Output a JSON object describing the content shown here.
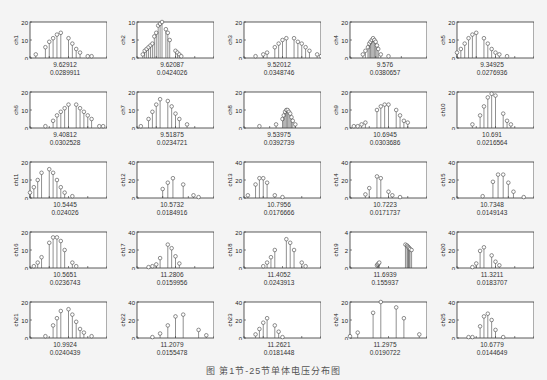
{
  "caption": "图  第1节-25节单体电压分布图",
  "chart_data": [
    {
      "type": "scatter",
      "name": "ch1",
      "ylabel": "ch1",
      "xlim": [
        9.55,
        9.75
      ],
      "ylim": [
        0,
        20
      ],
      "xticks": [
        "9.55",
        "9.6",
        "9.65",
        "9.7",
        "9.75"
      ],
      "yticks": [
        "0",
        "10",
        "20"
      ],
      "mean": "9.62912",
      "std": "0.0289911",
      "x": [
        9.565,
        9.59,
        9.6,
        9.61,
        9.62,
        9.63,
        9.65,
        9.66,
        9.67,
        9.68,
        9.7,
        9.71
      ],
      "y": [
        2,
        6,
        9,
        11,
        13,
        14,
        11,
        8,
        5,
        3,
        1,
        1
      ]
    },
    {
      "type": "scatter",
      "name": "ch2",
      "ylabel": "ch2",
      "xlim": [
        9.5,
        9.9
      ],
      "ylim": [
        0,
        10
      ],
      "xticks": [
        "9.5",
        "9.6",
        "9.7",
        "9.8",
        "9.9"
      ],
      "yticks": [
        "0",
        "5",
        "10"
      ],
      "mean": "9.62087",
      "std": "0.0424026",
      "x": [
        9.53,
        9.54,
        9.55,
        9.56,
        9.57,
        9.58,
        9.59,
        9.6,
        9.61,
        9.62,
        9.63,
        9.65,
        9.66,
        9.67,
        9.7,
        9.71,
        9.72,
        9.73
      ],
      "y": [
        1,
        2,
        2.5,
        3,
        3.5,
        4,
        6,
        7,
        9,
        9.5,
        10,
        8,
        7,
        5,
        2,
        1.5,
        1,
        0.5
      ]
    },
    {
      "type": "scatter",
      "name": "ch3",
      "ylabel": "ch3",
      "xlim": [
        9.4,
        9.6
      ],
      "ylim": [
        0,
        20
      ],
      "xticks": [
        "9.4",
        "9.45",
        "9.5",
        "9.55",
        "9.6"
      ],
      "yticks": [
        "0",
        "10",
        "20"
      ],
      "mean": "9.52012",
      "std": "0.0348746",
      "x": [
        9.43,
        9.45,
        9.46,
        9.48,
        9.49,
        9.5,
        9.51,
        9.53,
        9.54,
        9.55,
        9.56,
        9.57,
        9.59,
        9.6
      ],
      "y": [
        1,
        2,
        3,
        6,
        8,
        10,
        11,
        11,
        9,
        8,
        6,
        4,
        2,
        1
      ]
    },
    {
      "type": "scatter",
      "name": "ch4",
      "ylabel": "ch4",
      "xlim": [
        9.4,
        10
      ],
      "ylim": [
        0,
        20
      ],
      "xticks": [
        "9.4",
        "9.6",
        "9.8",
        "10"
      ],
      "yticks": [
        "0",
        "10",
        "20"
      ],
      "mean": "9.576",
      "std": "0.0380657",
      "x": [
        9.5,
        9.52,
        9.54,
        9.55,
        9.56,
        9.57,
        9.58,
        9.59,
        9.6,
        9.61,
        9.62,
        9.64,
        9.7
      ],
      "y": [
        2,
        4,
        6,
        8,
        9,
        10,
        11,
        10,
        9,
        7,
        5,
        2,
        1
      ]
    },
    {
      "type": "scatter",
      "name": "ch5",
      "ylabel": "ch5",
      "xlim": [
        9.3,
        9.5
      ],
      "ylim": [
        0,
        20
      ],
      "xticks": [
        "9.3",
        "9.35",
        "9.4",
        "9.45",
        "9.5"
      ],
      "yticks": [
        "0",
        "10",
        "20"
      ],
      "mean": "9.34925",
      "std": "0.0276936",
      "x": [
        9.3,
        9.31,
        9.32,
        9.33,
        9.34,
        9.35,
        9.37,
        9.38,
        9.39,
        9.4,
        9.41,
        9.43
      ],
      "y": [
        3,
        5,
        8,
        11,
        13,
        14,
        11,
        8,
        5,
        3,
        2,
        1
      ]
    },
    {
      "type": "scatter",
      "name": "ch6",
      "ylabel": "ch6",
      "xlim": [
        9.3,
        9.5
      ],
      "ylim": [
        0,
        20
      ],
      "xticks": [
        "9.3",
        "9.35",
        "9.4",
        "9.45",
        "9.5"
      ],
      "yticks": [
        "0",
        "10",
        "20"
      ],
      "mean": "9.40812",
      "std": "0.0302528",
      "x": [
        9.34,
        9.36,
        9.37,
        9.38,
        9.39,
        9.4,
        9.42,
        9.43,
        9.44,
        9.45,
        9.46,
        9.48,
        9.49
      ],
      "y": [
        1,
        4,
        7,
        9,
        11,
        13,
        13,
        11,
        9,
        7,
        5,
        1,
        1
      ]
    },
    {
      "type": "scatter",
      "name": "ch7",
      "ylabel": "ch7",
      "xlim": [
        9.45,
        9.65
      ],
      "ylim": [
        0,
        20
      ],
      "xticks": [
        "9.45",
        "9.5",
        "9.55",
        "9.6",
        "9.65"
      ],
      "yticks": [
        "0",
        "10",
        "20"
      ],
      "mean": "9.51875",
      "std": "0.0234721",
      "x": [
        9.46,
        9.48,
        9.49,
        9.5,
        9.51,
        9.53,
        9.54,
        9.55,
        9.56,
        9.58
      ],
      "y": [
        1,
        5,
        9,
        13,
        16,
        15,
        12,
        8,
        5,
        2
      ]
    },
    {
      "type": "scatter",
      "name": "ch8",
      "ylabel": "ch8",
      "xlim": [
        9.2,
        9.8
      ],
      "ylim": [
        0,
        20
      ],
      "xticks": [
        "9.2",
        "9.4",
        "9.6",
        "9.8"
      ],
      "yticks": [
        "0",
        "10",
        "20"
      ],
      "mean": "9.53975",
      "std": "0.0392739",
      "x": [
        9.32,
        9.45,
        9.5,
        9.51,
        9.52,
        9.53,
        9.54,
        9.55,
        9.56,
        9.57,
        9.58,
        9.6
      ],
      "y": [
        1,
        2,
        5,
        7,
        9,
        10,
        10,
        9,
        8,
        6,
        4,
        2
      ]
    },
    {
      "type": "scatter",
      "name": "ch9",
      "ylabel": "ch9",
      "xlim": [
        10.6,
        10.8
      ],
      "ylim": [
        0,
        20
      ],
      "xticks": [
        "10.65",
        "10.7",
        "10.75",
        "10.8"
      ],
      "yticks": [
        "0",
        "10",
        "20"
      ],
      "mean": "10.6945",
      "std": "0.0303686",
      "x": [
        10.61,
        10.62,
        10.63,
        10.64,
        10.67,
        10.68,
        10.69,
        10.7,
        10.72,
        10.73,
        10.74,
        10.75
      ],
      "y": [
        1,
        1,
        2,
        3,
        10,
        12,
        13,
        13,
        10,
        7,
        4,
        3
      ]
    },
    {
      "type": "scatter",
      "name": "ch10",
      "ylabel": "ch10",
      "xlim": [
        10.6,
        10.8
      ],
      "ylim": [
        0,
        20
      ],
      "xticks": [
        "10.65",
        "10.7",
        "10.75",
        "10.8"
      ],
      "yticks": [
        "0",
        "20"
      ],
      "mean": "10.691",
      "std": "0.0216564",
      "x": [
        10.64,
        10.66,
        10.67,
        10.68,
        10.69,
        10.7,
        10.72,
        10.73,
        10.74
      ],
      "y": [
        2,
        7,
        12,
        17,
        19,
        18,
        8,
        4,
        2
      ]
    },
    {
      "type": "scatter",
      "name": "ch11",
      "ylabel": "ch11",
      "xlim": [
        10.5,
        10.7
      ],
      "ylim": [
        0,
        20
      ],
      "xticks": [
        "10.5",
        "10.55",
        "10.6",
        "10.65",
        "10.7"
      ],
      "yticks": [
        "0",
        "10",
        "20"
      ],
      "mean": "10.5445",
      "std": "0.024026",
      "x": [
        10.5,
        10.51,
        10.52,
        10.53,
        10.55,
        10.56,
        10.57,
        10.58,
        10.59,
        10.61
      ],
      "y": [
        3,
        6,
        10,
        14,
        16,
        14,
        10,
        6,
        3,
        1
      ]
    },
    {
      "type": "scatter",
      "name": "ch12",
      "ylabel": "ch12",
      "xlim": [
        10.5,
        10.65
      ],
      "ylim": [
        0,
        40
      ],
      "xticks": [
        "10.5",
        "10.55",
        "10.6",
        "10.65"
      ],
      "yticks": [
        "0",
        "20",
        "40"
      ],
      "mean": "10.5732",
      "std": "0.0184916",
      "x": [
        10.55,
        10.56,
        10.57,
        10.59,
        10.61,
        10.62
      ],
      "y": [
        10,
        17,
        22,
        15,
        3,
        1
      ]
    },
    {
      "type": "scatter",
      "name": "ch13",
      "ylabel": "ch13",
      "xlim": [
        10.75,
        10.95
      ],
      "ylim": [
        0,
        40
      ],
      "xticks": [
        "10.75",
        "10.8",
        "10.85",
        "10.9",
        "10.95"
      ],
      "yticks": [
        "0",
        "20",
        "40"
      ],
      "mean": "10.7956",
      "std": "0.0176666",
      "x": [
        10.76,
        10.78,
        10.79,
        10.8,
        10.81,
        10.83,
        10.85
      ],
      "y": [
        3,
        15,
        22,
        22,
        17,
        3,
        1
      ]
    },
    {
      "type": "scatter",
      "name": "ch14",
      "ylabel": "ch14",
      "xlim": [
        10.65,
        10.85
      ],
      "ylim": [
        0,
        40
      ],
      "xticks": [
        "10.65",
        "10.7",
        "10.75",
        "10.8",
        "10.85"
      ],
      "yticks": [
        "0",
        "20",
        "40"
      ],
      "mean": "10.7223",
      "std": "0.0171737",
      "x": [
        10.69,
        10.7,
        10.72,
        10.73,
        10.75,
        10.76,
        10.78
      ],
      "y": [
        4,
        11,
        24,
        22,
        7,
        3,
        1
      ]
    },
    {
      "type": "scatter",
      "name": "ch15",
      "ylabel": "ch15",
      "xlim": [
        10.65,
        10.8
      ],
      "ylim": [
        0,
        40
      ],
      "xticks": [
        "10.65",
        "10.7",
        "10.75",
        "10.8"
      ],
      "yticks": [
        "0",
        "20",
        "40"
      ],
      "mean": "10.7348",
      "std": "0.0149143",
      "x": [
        10.7,
        10.72,
        10.73,
        10.74,
        10.75,
        10.76,
        10.78
      ],
      "y": [
        2,
        18,
        26,
        26,
        17,
        7,
        1
      ]
    },
    {
      "type": "scatter",
      "name": "ch16",
      "ylabel": "ch16",
      "xlim": [
        10.5,
        10.7
      ],
      "ylim": [
        0,
        20
      ],
      "xticks": [
        "10.5",
        "10.55",
        "10.6",
        "10.65",
        "10.7"
      ],
      "yticks": [
        "0",
        "10",
        "20"
      ],
      "mean": "10.5651",
      "std": "0.0236743",
      "x": [
        10.51,
        10.52,
        10.53,
        10.55,
        10.56,
        10.57,
        10.58,
        10.59,
        10.61,
        10.62
      ],
      "y": [
        1,
        3,
        6,
        14,
        17,
        17,
        15,
        10,
        3,
        1
      ]
    },
    {
      "type": "scatter",
      "name": "ch17",
      "ylabel": "ch17",
      "xlim": [
        11.2,
        11.4
      ],
      "ylim": [
        0,
        40
      ],
      "xticks": [
        "11.2",
        "11.25",
        "11.3",
        "11.35",
        "11.4"
      ],
      "yticks": [
        "0",
        "20",
        "40"
      ],
      "mean": "11.2806",
      "std": "0.0159956",
      "x": [
        11.23,
        11.24,
        11.25,
        11.26,
        11.28,
        11.29,
        11.3,
        11.31
      ],
      "y": [
        1,
        2,
        4,
        11,
        26,
        22,
        13,
        5
      ]
    },
    {
      "type": "scatter",
      "name": "ch18",
      "ylabel": "ch18",
      "xlim": [
        11.3,
        11.5
      ],
      "ylim": [
        0,
        20
      ],
      "xticks": [
        "11.3",
        "11.35",
        "11.4",
        "11.45",
        "11.5"
      ],
      "yticks": [
        "0",
        "10",
        "20"
      ],
      "mean": "11.4052",
      "std": "0.0243913",
      "x": [
        11.35,
        11.36,
        11.37,
        11.38,
        11.41,
        11.42,
        11.43,
        11.45,
        11.46
      ],
      "y": [
        1,
        3,
        6,
        10,
        16,
        14,
        10,
        3,
        1
      ]
    },
    {
      "type": "scatter",
      "name": "ch19",
      "ylabel": "ch19",
      "xlim": [
        11,
        12
      ],
      "ylim": [
        0,
        4
      ],
      "xticks": [
        "11",
        "11.5",
        "12"
      ],
      "yticks": [
        "0",
        "2",
        "4"
      ],
      "mean": "11.6939",
      "std": "0.155937",
      "x": [
        11.35,
        11.36,
        11.37,
        11.38,
        11.72,
        11.74,
        11.75,
        11.76,
        11.77,
        11.78,
        11.8
      ],
      "y": [
        0.3,
        0.4,
        0.5,
        0.6,
        2.6,
        2.5,
        2.4,
        2.3,
        2.2,
        2.1,
        2.0
      ]
    },
    {
      "type": "scatter",
      "name": "ch20",
      "ylabel": "ch20",
      "xlim": [
        11.25,
        11.45
      ],
      "ylim": [
        0,
        40
      ],
      "xticks": [
        "11.25",
        "11.3",
        "11.35",
        "11.4",
        "11.45"
      ],
      "yticks": [
        "0",
        "20",
        "40"
      ],
      "mean": "11.3211",
      "std": "0.0183707",
      "x": [
        11.29,
        11.3,
        11.31,
        11.32,
        11.34,
        11.35,
        11.36
      ],
      "y": [
        1,
        5,
        19,
        23,
        14,
        7,
        3
      ]
    },
    {
      "type": "scatter",
      "name": "ch21",
      "ylabel": "ch21",
      "xlim": [
        10.9,
        11.1
      ],
      "ylim": [
        0,
        20
      ],
      "xticks": [
        "10.9",
        "10.95",
        "11",
        "11.05",
        "11.1"
      ],
      "yticks": [
        "0",
        "10",
        "20"
      ],
      "mean": "10.9924",
      "std": "0.0240439",
      "x": [
        10.94,
        10.96,
        10.97,
        10.98,
        11.0,
        11.01,
        11.02,
        11.03,
        11.04,
        11.06
      ],
      "y": [
        1,
        7,
        11,
        15,
        16,
        13,
        9,
        5,
        3,
        1
      ]
    },
    {
      "type": "scatter",
      "name": "ch22",
      "ylabel": "ch22",
      "xlim": [
        11.15,
        11.25
      ],
      "ylim": [
        0,
        40
      ],
      "xticks": [
        "11.15",
        "11.2",
        "11.25"
      ],
      "yticks": [
        "0",
        "20",
        "40"
      ],
      "mean": "11.2079",
      "std": "0.0155478",
      "x": [
        11.17,
        11.18,
        11.19,
        11.2,
        11.21,
        11.23,
        11.24
      ],
      "y": [
        1,
        5,
        14,
        24,
        26,
        9,
        3
      ]
    },
    {
      "type": "scatter",
      "name": "ch23",
      "ylabel": "ch23",
      "xlim": [
        11.2,
        11.4
      ],
      "ylim": [
        0,
        40
      ],
      "xticks": [
        "11.2",
        "11.25",
        "11.3",
        "11.35",
        "11.4"
      ],
      "yticks": [
        "0",
        "20",
        "40"
      ],
      "mean": "11.2621",
      "std": "0.0181448",
      "x": [
        11.23,
        11.24,
        11.25,
        11.26,
        11.28,
        11.29,
        11.3
      ],
      "y": [
        4,
        10,
        17,
        22,
        14,
        7,
        1
      ]
    },
    {
      "type": "scatter",
      "name": "ch24",
      "ylabel": "ch24",
      "xlim": [
        11.25,
        11.35
      ],
      "ylim": [
        0,
        20
      ],
      "xticks": [
        "11.25",
        "11.3",
        "11.35"
      ],
      "yticks": [
        "0",
        "10",
        "20"
      ],
      "mean": "11.2975",
      "std": "0.0190722",
      "x": [
        11.25,
        11.26,
        11.28,
        11.29,
        11.31,
        11.32,
        11.34
      ],
      "y": [
        1,
        3,
        14,
        20,
        17,
        11,
        2
      ]
    },
    {
      "type": "scatter",
      "name": "ch25",
      "ylabel": "ch25",
      "xlim": [
        10.6,
        10.8
      ],
      "ylim": [
        0,
        40
      ],
      "xticks": [
        "10.65",
        "10.7",
        "10.75",
        "10.8"
      ],
      "yticks": [
        "0",
        "20",
        "40"
      ],
      "mean": "10.6779",
      "std": "0.0144649",
      "x": [
        10.63,
        10.64,
        10.66,
        10.67,
        10.68,
        10.69,
        10.7,
        10.72
      ],
      "y": [
        1,
        1,
        13,
        24,
        27,
        20,
        9,
        1
      ]
    }
  ]
}
